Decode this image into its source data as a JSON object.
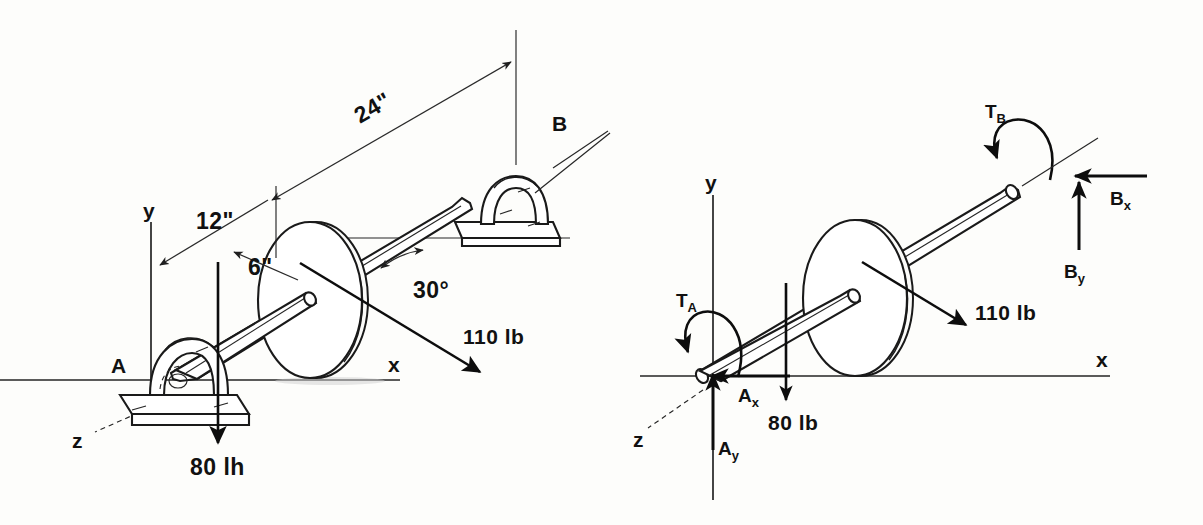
{
  "figure": {
    "background_color": "#fdfdfb",
    "ink_color": "#1a1a1a"
  },
  "left_diagram": {
    "name": "space-diagram",
    "axes": {
      "x": "x",
      "y": "y",
      "z": "z"
    },
    "supports": [
      {
        "id": "A",
        "label": "A",
        "type": "pillow-block-bearing"
      },
      {
        "id": "B",
        "label": "B",
        "type": "pillow-block-bearing"
      }
    ],
    "dimensions": [
      {
        "label": "24\"",
        "value": 24,
        "unit": "in",
        "from": "A",
        "to": "B"
      },
      {
        "label": "12\"",
        "value": 12,
        "unit": "in",
        "from": "A",
        "to": "disk"
      },
      {
        "label": "6\"",
        "value": 6,
        "unit": "in",
        "description": "disk radius"
      }
    ],
    "angle": {
      "label": "30°",
      "value": 30,
      "unit": "deg"
    },
    "forces": [
      {
        "label": "110 lb",
        "value": 110,
        "unit": "lb",
        "direction": "down-right along belt"
      },
      {
        "label": "80 lh",
        "value": 80,
        "unit": "lb",
        "direction": "down"
      }
    ]
  },
  "right_diagram": {
    "name": "free-body-diagram",
    "axes": {
      "x": "x",
      "y": "y",
      "z": "z"
    },
    "reactions": [
      {
        "label": "T_A",
        "base": "T",
        "sub": "A",
        "type": "couple",
        "sense": "counterclockwise"
      },
      {
        "label": "A_x",
        "base": "A",
        "sub": "x",
        "type": "force",
        "direction": "-x"
      },
      {
        "label": "A_y",
        "base": "A",
        "sub": "y",
        "type": "force",
        "direction": "+y"
      },
      {
        "label": "T_B",
        "base": "T",
        "sub": "B",
        "type": "couple",
        "sense": "counterclockwise"
      },
      {
        "label": "B_x",
        "base": "B",
        "sub": "x",
        "type": "force",
        "direction": "-x"
      },
      {
        "label": "B_y",
        "base": "B",
        "sub": "y",
        "type": "force",
        "direction": "+y"
      }
    ],
    "forces": [
      {
        "label": "110 lb",
        "value": 110,
        "unit": "lb",
        "direction": "down-right along belt"
      },
      {
        "label": "80 lb",
        "value": 80,
        "unit": "lb",
        "direction": "down"
      }
    ]
  },
  "labels": {
    "dim_24": "24\"",
    "dim_12": "12\"",
    "dim_6": "6\"",
    "angle_30": "30°",
    "force_110_left": "110 lb",
    "force_80_left": "80 lh",
    "force_110_right": "110 lb",
    "force_80_right": "80 lb",
    "bearing_a": "A",
    "bearing_b": "B",
    "axis_x_left": "x",
    "axis_y_left": "y",
    "axis_z_left": "z",
    "axis_x_right": "x",
    "axis_y_right": "y",
    "axis_z_right": "z",
    "ta_base": "T",
    "ta_sub": "A",
    "tb_base": "T",
    "tb_sub": "B",
    "ax_base": "A",
    "ax_sub": "x",
    "ay_base": "A",
    "ay_sub": "y",
    "bx_base": "B",
    "bx_sub": "x",
    "by_base": "B",
    "by_sub": "y"
  }
}
